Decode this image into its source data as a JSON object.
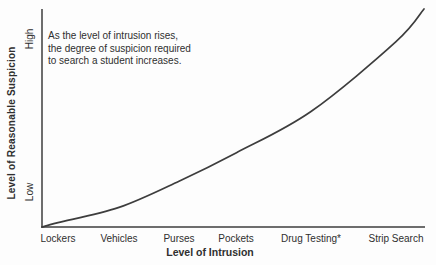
{
  "figure": {
    "annotation": "As the level of intrusion rises,\nthe degree of suspicion required\nto search a student increases.",
    "y_axis": {
      "title": "Level of Reasonable Suspicion",
      "top_label": "High",
      "bottom_label": "Low"
    },
    "x_axis": {
      "title": "Level of Intrusion"
    }
  },
  "chart_data": {
    "type": "line",
    "title": "",
    "categories": [
      "Lockers",
      "Vehicles",
      "Purses",
      "Pockets",
      "Drug Testing*",
      "Strip Search"
    ],
    "series": [
      {
        "name": "Degree of suspicion required to search",
        "values": [
          0.02,
          0.09,
          0.21,
          0.34,
          0.53,
          0.85
        ]
      }
    ],
    "curve_endpoints": {
      "start_value": 0.0,
      "end_value": 1.0
    },
    "shape": "convex-increasing",
    "xlabel": "Level of Intrusion",
    "ylabel": "Level of Reasonable Suspicion",
    "y_tick_labels": [
      "Low",
      "High"
    ],
    "ylim": [
      0,
      1
    ],
    "grid": false,
    "legend": false,
    "annotation": "As the level of intrusion rises, the degree of suspicion required to search a student increases.",
    "line_color": "#3d3d3d",
    "ink_color": "#2f2f2f"
  }
}
